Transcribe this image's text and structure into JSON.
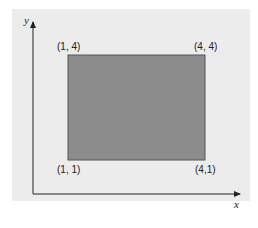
{
  "figure": {
    "axes": {
      "x_label": "x",
      "y_label": "y"
    },
    "rectangle": {
      "fill": "#8c8c8c",
      "stroke": "#555555"
    },
    "corners": {
      "top_left": "(1, 4)",
      "top_right": "(4, 4)",
      "bottom_left": "(1, 1)",
      "bottom_right": "(4,1)"
    },
    "background": "#ececec"
  }
}
